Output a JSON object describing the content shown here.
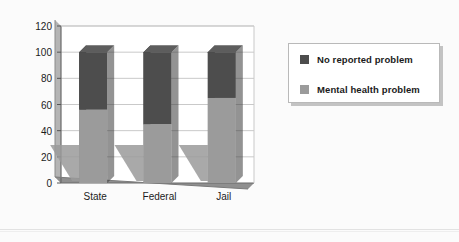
{
  "chart_data": {
    "type": "bar",
    "subtype": "stacked-3d-column",
    "title": "",
    "subtitle": "",
    "xlabel": "",
    "ylabel": "",
    "categories": [
      "State",
      "Federal",
      "Jail"
    ],
    "series": [
      {
        "name": "Mental health problem",
        "color": "#9b9b9b",
        "values": [
          56,
          45,
          65
        ]
      },
      {
        "name": "No reported problem",
        "color": "#4d4d4d",
        "values": [
          44,
          55,
          35
        ]
      }
    ],
    "stack_totals": [
      100,
      100,
      100
    ],
    "ylim": [
      0,
      120
    ],
    "yticks": [
      0,
      20,
      40,
      60,
      80,
      100,
      120
    ],
    "ytick_labels": [
      "0",
      "20",
      "40",
      "60",
      "80",
      "100",
      "120"
    ],
    "grid": "horizontal",
    "legend_position": "right",
    "legend_entries": [
      {
        "label": "No reported problem",
        "color": "#4d4d4d"
      },
      {
        "label": "Mental health problem",
        "color": "#9b9b9b"
      }
    ]
  },
  "axis": {
    "y_labels": [
      "120",
      "100",
      "80",
      "60",
      "40",
      "20",
      "0"
    ],
    "x_labels": [
      "State",
      "Federal",
      "Jail"
    ]
  },
  "legend": {
    "items": [
      {
        "label": "No reported problem",
        "swatch": "#4d4d4d"
      },
      {
        "label": "Mental health problem",
        "swatch": "#9b9b9b"
      }
    ]
  },
  "colors": {
    "dark_series": "#4d4d4d",
    "light_series": "#9b9b9b",
    "dark_series_top": "#5d5d5d",
    "dark_series_side": "#3a3a3a",
    "light_series_side": "#838383",
    "shadow": "#9a9a9a",
    "grid": "#c9c9c9",
    "axis": "#555555",
    "plot_bg": "#ffffff",
    "figure_bg": "#fbfbfb",
    "text": "#1b1b1b"
  }
}
